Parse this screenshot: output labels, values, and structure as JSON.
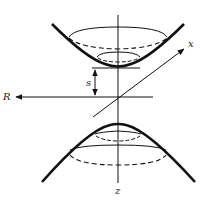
{
  "figure": {
    "type": "two-sheeted hyperboloid with coordinate axes",
    "colors": {
      "stroke": "#111111",
      "background": "#ffffff"
    },
    "labels": {
      "x_axis": "x",
      "z_axis": "z",
      "horizontal_axis": "R",
      "gap": "s"
    }
  }
}
